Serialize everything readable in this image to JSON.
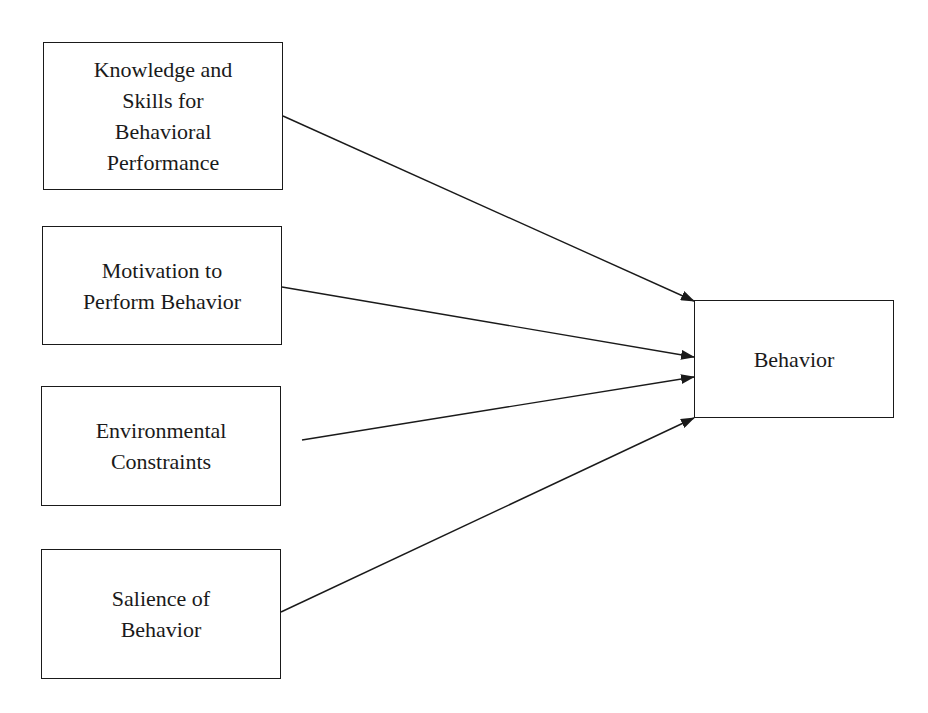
{
  "diagram": {
    "inputs": [
      {
        "id": "knowledge",
        "lines": [
          "Knowledge and",
          "Skills for",
          "Behavioral",
          "Performance"
        ]
      },
      {
        "id": "motivation",
        "lines": [
          "Motivation to",
          "Perform Behavior"
        ]
      },
      {
        "id": "environment",
        "lines": [
          "Environmental",
          "Constraints"
        ]
      },
      {
        "id": "salience",
        "lines": [
          "Salience of",
          "Behavior"
        ]
      }
    ],
    "output": {
      "id": "behavior",
      "label": "Behavior"
    },
    "edges": [
      {
        "from": "knowledge",
        "to": "behavior"
      },
      {
        "from": "motivation",
        "to": "behavior"
      },
      {
        "from": "environment",
        "to": "behavior"
      },
      {
        "from": "salience",
        "to": "behavior"
      }
    ],
    "colors": {
      "stroke": "#1a1a1a",
      "background": "#ffffff"
    }
  }
}
